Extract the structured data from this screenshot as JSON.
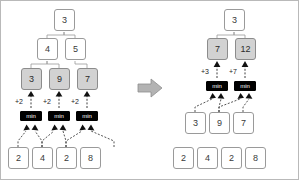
{
  "figure": {
    "transition_icon": "right-arrow-icon",
    "colors": {
      "node_fill": "#ffffff",
      "node_shaded_fill": "#d2d2d2",
      "node_border": "#9a9a9a",
      "minbox_fill": "#000000",
      "minbox_text": "#ffffff",
      "arrow_fill": "#b3b3b3",
      "panel_border": "#b9b9b9",
      "text": "#3a3a3a"
    },
    "minbox_label": "min"
  },
  "left": {
    "name": "before-state",
    "rows": [
      {
        "name": "root-row",
        "nodes": [
          {
            "value": "3",
            "shaded": false
          }
        ]
      },
      {
        "name": "level-2-row",
        "nodes": [
          {
            "value": "4",
            "shaded": false
          },
          {
            "value": "5",
            "shaded": false
          }
        ]
      },
      {
        "name": "level-3-row",
        "nodes": [
          {
            "value": "3",
            "shaded": true
          },
          {
            "value": "9",
            "shaded": true
          },
          {
            "value": "7",
            "shaded": true
          }
        ]
      },
      {
        "name": "leaf-row",
        "nodes": [
          {
            "value": "2",
            "shaded": false
          },
          {
            "value": "4",
            "shaded": false
          },
          {
            "value": "2",
            "shaded": false
          },
          {
            "value": "8",
            "shaded": false
          }
        ]
      }
    ],
    "deltas": [
      "+2",
      "+2",
      "+2"
    ],
    "minboxes": [
      "min",
      "min",
      "min"
    ]
  },
  "right": {
    "name": "after-state",
    "rows": [
      {
        "name": "root-row",
        "nodes": [
          {
            "value": "3",
            "shaded": false
          }
        ]
      },
      {
        "name": "level-2-row",
        "nodes": [
          {
            "value": "7",
            "shaded": true
          },
          {
            "value": "12",
            "shaded": true
          }
        ]
      },
      {
        "name": "level-3-row",
        "nodes": [
          {
            "value": "3",
            "shaded": false
          },
          {
            "value": "9",
            "shaded": false
          },
          {
            "value": "7",
            "shaded": false
          }
        ]
      },
      {
        "name": "leaf-row",
        "nodes": [
          {
            "value": "2",
            "shaded": false
          },
          {
            "value": "4",
            "shaded": false
          },
          {
            "value": "2",
            "shaded": false
          },
          {
            "value": "8",
            "shaded": false
          }
        ]
      }
    ],
    "deltas": [
      "+3",
      "+7"
    ],
    "minboxes": [
      "min",
      "min"
    ]
  }
}
